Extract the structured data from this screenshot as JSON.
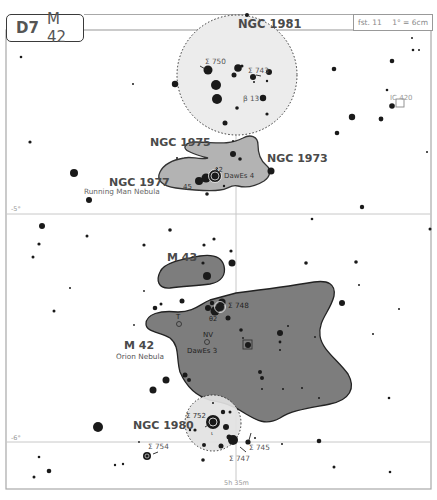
{
  "header": {
    "chart_code": "D7",
    "object": "M 42",
    "field_label": "fst. 11",
    "scale_label": "1° = 6cm"
  },
  "axes": {
    "dec_labels": [
      "-5°",
      "-6°"
    ],
    "ra_label": "5h 35m"
  },
  "objects": {
    "ngc1981": "NGC 1981",
    "ngc1975": "NGC 1975",
    "ngc1973": "NGC 1973",
    "ngc1977": "NGC 1977",
    "ngc1977_name": "Running Man Nebula",
    "m43": "M 43",
    "m42": "M 42",
    "m42_name": "Orion Nebula",
    "ngc1980": "NGC 1980",
    "ic420": "IC 420"
  },
  "star_labels": {
    "s750": "Σ 750",
    "s743": "Σ 743",
    "b13": "β 13",
    "n42": "42",
    "n45": "45",
    "dawes4": "DawEs 4",
    "s748": "Σ 748",
    "theta2": "θ2",
    "t": "T",
    "nv": "NV",
    "dawes3": "DawEs 3",
    "s752": "Σ 752",
    "iota": "ι",
    "s754": "Σ 754",
    "s747": "Σ 747",
    "s745": "Σ 745",
    "trap": "Σ"
  },
  "colors": {
    "nebula_fill": "#7d7d7d",
    "nebula_light": "#b3b3b3",
    "cluster_fill": "#ececec",
    "star": "#1a1a1a",
    "grid": "#c8c8c8",
    "frame": "#a0a0a0"
  }
}
